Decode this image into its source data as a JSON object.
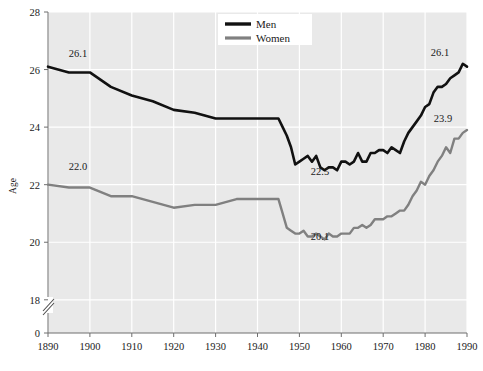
{
  "chart_data": {
    "type": "line",
    "title": "",
    "subtitle": "",
    "xlabel": "",
    "ylabel": "Age",
    "xlim": [
      1890,
      1990
    ],
    "ylim": [
      17.2,
      28
    ],
    "y_axis_break": true,
    "y_axis_break_note": "axis broken between 18 and 0",
    "grid": true,
    "legend_position": "top-center",
    "x_ticks": [
      1890,
      1900,
      1910,
      1920,
      1930,
      1940,
      1950,
      1960,
      1970,
      1980,
      1990
    ],
    "y_ticks": [
      0,
      18,
      20,
      22,
      24,
      26,
      28
    ],
    "annotations": [
      {
        "text": "26.1",
        "series": "Men",
        "x": 1890,
        "y": 26.1,
        "position": "above-right"
      },
      {
        "text": "22.0",
        "series": "Women",
        "x": 1890,
        "y": 22.0,
        "position": "above-right"
      },
      {
        "text": "22.5",
        "series": "Men",
        "x": 1956,
        "y": 22.5,
        "position": "below"
      },
      {
        "text": "20.1",
        "series": "Women",
        "x": 1956,
        "y": 20.1,
        "position": "below"
      },
      {
        "text": "26.1",
        "series": "Men",
        "x": 1990,
        "y": 26.1,
        "position": "above-left"
      },
      {
        "text": "23.9",
        "series": "Women",
        "x": 1990,
        "y": 23.9,
        "position": "above-left"
      }
    ],
    "series": [
      {
        "name": "Men",
        "color": "#111111",
        "x": [
          1890,
          1895,
          1900,
          1905,
          1910,
          1915,
          1920,
          1925,
          1930,
          1935,
          1940,
          1941,
          1942,
          1943,
          1944,
          1945,
          1946,
          1947,
          1948,
          1949,
          1950,
          1951,
          1952,
          1953,
          1954,
          1955,
          1956,
          1957,
          1958,
          1959,
          1960,
          1961,
          1962,
          1963,
          1964,
          1965,
          1966,
          1967,
          1968,
          1969,
          1970,
          1971,
          1972,
          1973,
          1974,
          1975,
          1976,
          1977,
          1978,
          1979,
          1980,
          1981,
          1982,
          1983,
          1984,
          1985,
          1986,
          1987,
          1988,
          1989,
          1990
        ],
        "y": [
          26.1,
          25.9,
          25.9,
          25.4,
          25.1,
          24.9,
          24.6,
          24.5,
          24.3,
          24.3,
          24.3,
          24.3,
          24.3,
          24.3,
          24.3,
          24.3,
          24.0,
          23.7,
          23.3,
          22.7,
          22.8,
          22.9,
          23.0,
          22.8,
          23.0,
          22.6,
          22.5,
          22.6,
          22.6,
          22.5,
          22.8,
          22.8,
          22.7,
          22.8,
          23.1,
          22.8,
          22.8,
          23.1,
          23.1,
          23.2,
          23.2,
          23.1,
          23.3,
          23.2,
          23.1,
          23.5,
          23.8,
          24.0,
          24.2,
          24.4,
          24.7,
          24.8,
          25.2,
          25.4,
          25.4,
          25.5,
          25.7,
          25.8,
          25.9,
          26.2,
          26.1
        ]
      },
      {
        "name": "Women",
        "color": "#808080",
        "x": [
          1890,
          1895,
          1900,
          1905,
          1910,
          1915,
          1920,
          1925,
          1930,
          1935,
          1940,
          1941,
          1942,
          1943,
          1944,
          1945,
          1946,
          1947,
          1948,
          1949,
          1950,
          1951,
          1952,
          1953,
          1954,
          1955,
          1956,
          1957,
          1958,
          1959,
          1960,
          1961,
          1962,
          1963,
          1964,
          1965,
          1966,
          1967,
          1968,
          1969,
          1970,
          1971,
          1972,
          1973,
          1974,
          1975,
          1976,
          1977,
          1978,
          1979,
          1980,
          1981,
          1982,
          1983,
          1984,
          1985,
          1986,
          1987,
          1988,
          1989,
          1990
        ],
        "y": [
          22.0,
          21.9,
          21.9,
          21.6,
          21.6,
          21.4,
          21.2,
          21.3,
          21.3,
          21.5,
          21.5,
          21.5,
          21.5,
          21.5,
          21.5,
          21.5,
          21.0,
          20.5,
          20.4,
          20.3,
          20.3,
          20.4,
          20.2,
          20.2,
          20.3,
          20.2,
          20.1,
          20.3,
          20.2,
          20.2,
          20.3,
          20.3,
          20.3,
          20.5,
          20.5,
          20.6,
          20.5,
          20.6,
          20.8,
          20.8,
          20.8,
          20.9,
          20.9,
          21.0,
          21.1,
          21.1,
          21.3,
          21.6,
          21.8,
          22.1,
          22.0,
          22.3,
          22.5,
          22.8,
          23.0,
          23.3,
          23.1,
          23.6,
          23.6,
          23.8,
          23.9
        ]
      }
    ]
  },
  "legend": {
    "items": [
      {
        "label": "Men",
        "color": "#111111"
      },
      {
        "label": "Women",
        "color": "#808080"
      }
    ]
  },
  "axes": {
    "y_title": "Age",
    "y_tick_labels": [
      "28",
      "26",
      "24",
      "22",
      "20",
      "18",
      "0"
    ],
    "x_tick_labels": [
      "1890",
      "1900",
      "1910",
      "1920",
      "1930",
      "1940",
      "1950",
      "1960",
      "1970",
      "1980",
      "1990"
    ]
  },
  "colors": {
    "plot_background": "#e9e9e9",
    "gridline": "#ffffff",
    "axis": "#7a7a7a",
    "text": "#1a1a1a",
    "men_line": "#111111",
    "women_line": "#808080",
    "legend_background": "#ffffff"
  },
  "labels": {
    "men_start": "26.1",
    "women_start": "22.0",
    "men_min": "22.5",
    "women_min": "20.1",
    "men_end": "26.1",
    "women_end": "23.9"
  }
}
